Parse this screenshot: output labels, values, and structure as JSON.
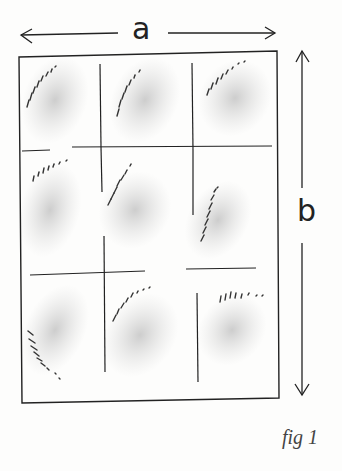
{
  "labels": {
    "width_label": "a",
    "height_label": "b",
    "caption": "fig 1"
  },
  "colors": {
    "ink": "#222222",
    "shade": "#c8c8c8",
    "background": "#fdfdfc"
  },
  "diagram": {
    "grid_rows": 3,
    "grid_cols": 3
  }
}
